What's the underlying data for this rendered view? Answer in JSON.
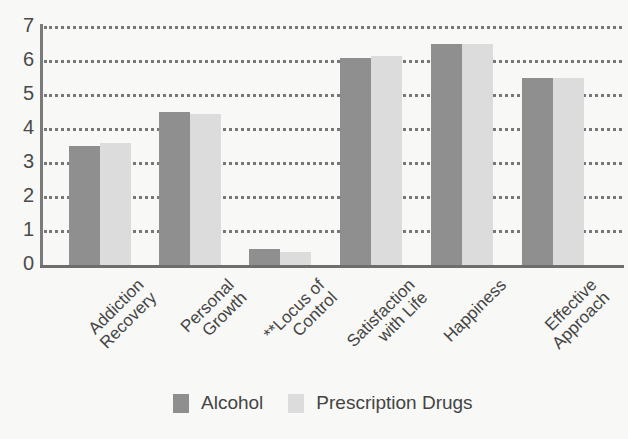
{
  "chart_data": {
    "type": "bar",
    "title": "",
    "xlabel": "",
    "ylabel": "",
    "ylim": [
      0,
      7
    ],
    "yticks": [
      0,
      1,
      2,
      3,
      4,
      5,
      6,
      7
    ],
    "grid": true,
    "legend_position": "bottom",
    "categories": [
      "Addiction Recovery",
      "Personal Growth",
      "**Locus of Control",
      "Satisfaction with Life",
      "Happiness",
      "Effective Approach"
    ],
    "category_lines": [
      [
        "Addiction",
        "Recovery"
      ],
      [
        "Personal",
        "Growth"
      ],
      [
        "**Locus of",
        "Control"
      ],
      [
        "Satisfaction",
        "with Life"
      ],
      [
        "Happiness"
      ],
      [
        "Effective",
        "Approach"
      ]
    ],
    "series": [
      {
        "name": "Alcohol",
        "color": "#8f8f8f",
        "values": [
          3.5,
          4.5,
          0.47,
          6.1,
          6.5,
          5.5
        ]
      },
      {
        "name": "Prescription Drugs",
        "color": "#dcdcdc",
        "values": [
          3.6,
          4.45,
          0.38,
          6.15,
          6.5,
          5.5
        ]
      }
    ]
  },
  "legend": {
    "items": [
      {
        "label": "Alcohol",
        "color": "#8f8f8f"
      },
      {
        "label": "Prescription Drugs",
        "color": "#dcdcdc"
      }
    ]
  }
}
